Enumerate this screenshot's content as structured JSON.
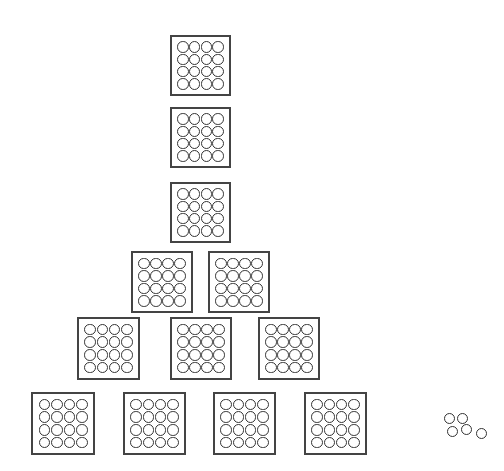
{
  "diagram": {
    "circles_per_box": 16,
    "box_rows": [
      {
        "row": 1,
        "count": 1,
        "boxes": [
          {
            "x": 170,
            "y": 35,
            "w": 61,
            "h": 61
          }
        ]
      },
      {
        "row": 2,
        "count": 1,
        "boxes": [
          {
            "x": 170,
            "y": 107,
            "w": 61,
            "h": 61
          }
        ]
      },
      {
        "row": 3,
        "count": 1,
        "boxes": [
          {
            "x": 170,
            "y": 182,
            "w": 61,
            "h": 61
          }
        ]
      },
      {
        "row": 4,
        "count": 2,
        "boxes": [
          {
            "x": 131,
            "y": 251,
            "w": 62,
            "h": 62
          },
          {
            "x": 208,
            "y": 251,
            "w": 62,
            "h": 62
          }
        ]
      },
      {
        "row": 5,
        "count": 3,
        "boxes": [
          {
            "x": 77,
            "y": 317,
            "w": 63,
            "h": 63
          },
          {
            "x": 170,
            "y": 317,
            "w": 62,
            "h": 63
          },
          {
            "x": 258,
            "y": 317,
            "w": 62,
            "h": 63
          }
        ]
      },
      {
        "row": 6,
        "count": 4,
        "boxes": [
          {
            "x": 31,
            "y": 392,
            "w": 64,
            "h": 63
          },
          {
            "x": 123,
            "y": 392,
            "w": 63,
            "h": 63
          },
          {
            "x": 213,
            "y": 392,
            "w": 63,
            "h": 63
          },
          {
            "x": 304,
            "y": 392,
            "w": 63,
            "h": 63
          }
        ]
      }
    ],
    "total_boxes": 12,
    "loose_circles": {
      "count": 5,
      "positions": [
        {
          "x": 444,
          "y": 413
        },
        {
          "x": 457,
          "y": 413
        },
        {
          "x": 447,
          "y": 426
        },
        {
          "x": 461,
          "y": 424
        },
        {
          "x": 476,
          "y": 428
        }
      ]
    },
    "colors": {
      "stroke": "#333333",
      "background": "#ffffff"
    }
  }
}
